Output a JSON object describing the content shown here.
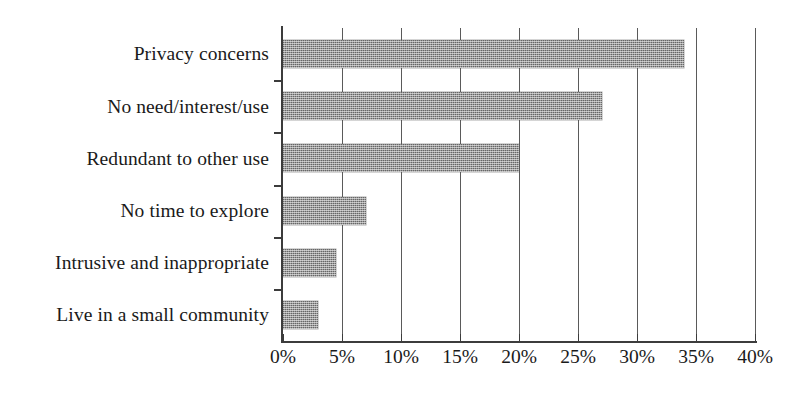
{
  "chart_data": {
    "type": "bar",
    "orientation": "horizontal",
    "title": "",
    "subtitle": "",
    "xlabel": "",
    "ylabel": "",
    "categories": [
      "Privacy concerns",
      "No need/interest/use",
      "Redundant to other use",
      "No time to explore",
      "Intrusive and inappropriate",
      "Live in a small community"
    ],
    "values": [
      34,
      27,
      20,
      7,
      4.5,
      3
    ],
    "value_unit": "%",
    "xlim": [
      0,
      40
    ],
    "xticks": [
      0,
      5,
      10,
      15,
      20,
      25,
      30,
      35,
      40
    ],
    "xtick_labels": [
      "0%",
      "5%",
      "10%",
      "15%",
      "20%",
      "25%",
      "30%",
      "35%",
      "40%"
    ],
    "grid": "vertical",
    "legend": null,
    "series": [
      {
        "name": "",
        "values": [
          34,
          27,
          20,
          7,
          4.5,
          3
        ]
      }
    ],
    "colors": {
      "bar_fill": "#9b9b9b",
      "bar_pattern": "halftone-dither-gray",
      "axis": "#3c3c3c",
      "gridline": "#5a5a5a",
      "background": "#ffffff",
      "text": "#1a1a1a"
    }
  }
}
